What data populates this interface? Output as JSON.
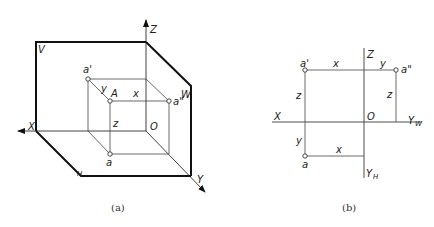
{
  "figure_a": {
    "caption": "(a)",
    "planes": {
      "v": "V",
      "h": "H",
      "w": "W"
    },
    "axes": {
      "x": "X",
      "y": "Y",
      "z": "Z",
      "origin": "O"
    },
    "points": {
      "space_point": "A",
      "front_projection": "a'",
      "top_projection": "a",
      "side_projection": "a\""
    },
    "dimensions": {
      "x": "x",
      "y": "y",
      "z": "z"
    }
  },
  "figure_b": {
    "caption": "(b)",
    "axes": {
      "x": "X",
      "z": "Z",
      "y_w": "Y",
      "y_w_sub": "W",
      "y_h": "Y",
      "y_h_sub": "H",
      "origin": "O"
    },
    "points": {
      "front_projection": "a'",
      "top_projection": "a",
      "side_projection": "a\""
    },
    "dimensions": {
      "x_top": "x",
      "y_top": "y",
      "z_left": "z",
      "z_right": "z",
      "y_left": "y",
      "x_bottom": "x"
    }
  },
  "colors": {
    "line": "#111111",
    "thin_line": "#444444",
    "background": "#ffffff"
  }
}
